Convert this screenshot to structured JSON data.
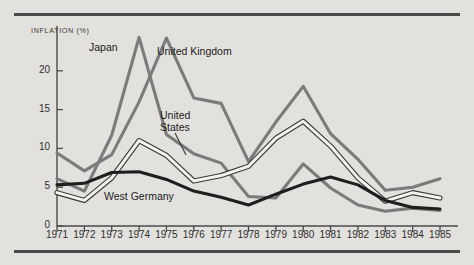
{
  "figure": {
    "background_color": "#e3e1dd",
    "rule_color": "#4a4a4a",
    "axis_title": "INFLATION (%)"
  },
  "labels": {
    "japan": "Japan",
    "united_kingdom": "United Kingdom",
    "united_states_line1": "United",
    "united_states_line2": "States",
    "west_germany": "West Germany"
  },
  "chart_data": {
    "type": "line",
    "title": "INFLATION (%)",
    "xlabel": "",
    "ylabel": "INFLATION (%)",
    "xlim": [
      1971,
      1985
    ],
    "ylim": [
      0,
      25
    ],
    "yticks": [
      0,
      5,
      10,
      15,
      20
    ],
    "ytick_labels": [
      "0",
      "5",
      "10",
      "15",
      "20"
    ],
    "grid": false,
    "legend": "inline-annotations",
    "x": [
      1971,
      1972,
      1973,
      1974,
      1975,
      1976,
      1977,
      1978,
      1979,
      1980,
      1981,
      1982,
      1983,
      1984,
      1985
    ],
    "xtick_labels": [
      "1971",
      "1972",
      "1973",
      "1974",
      "1975",
      "1976",
      "1977",
      "1978",
      "1979",
      "1980",
      "1981",
      "1982",
      "1983",
      "1984",
      "1985"
    ],
    "series": [
      {
        "name": "Japan",
        "color": "#7b7b7b",
        "values": [
          6.1,
          4.5,
          11.7,
          24.3,
          11.8,
          9.3,
          8.1,
          3.8,
          3.6,
          8.0,
          4.9,
          2.7,
          1.9,
          2.3,
          2.0
        ]
      },
      {
        "name": "United Kingdom",
        "color": "#7b7b7b",
        "values": [
          9.4,
          7.1,
          9.2,
          16.0,
          24.2,
          16.5,
          15.8,
          8.3,
          13.4,
          18.0,
          11.9,
          8.6,
          4.6,
          5.0,
          6.1
        ]
      },
      {
        "name": "United States",
        "color": "#f5f3ef",
        "outline_color": "#3a3a3a",
        "values": [
          4.3,
          3.3,
          6.2,
          11.0,
          9.1,
          5.8,
          6.5,
          7.7,
          11.3,
          13.5,
          10.3,
          6.2,
          3.2,
          4.3,
          3.6
        ]
      },
      {
        "name": "West Germany",
        "color": "#1e1e1e",
        "values": [
          5.3,
          5.5,
          6.9,
          7.0,
          6.0,
          4.5,
          3.7,
          2.7,
          4.1,
          5.4,
          6.3,
          5.3,
          3.3,
          2.4,
          2.2
        ]
      }
    ]
  }
}
